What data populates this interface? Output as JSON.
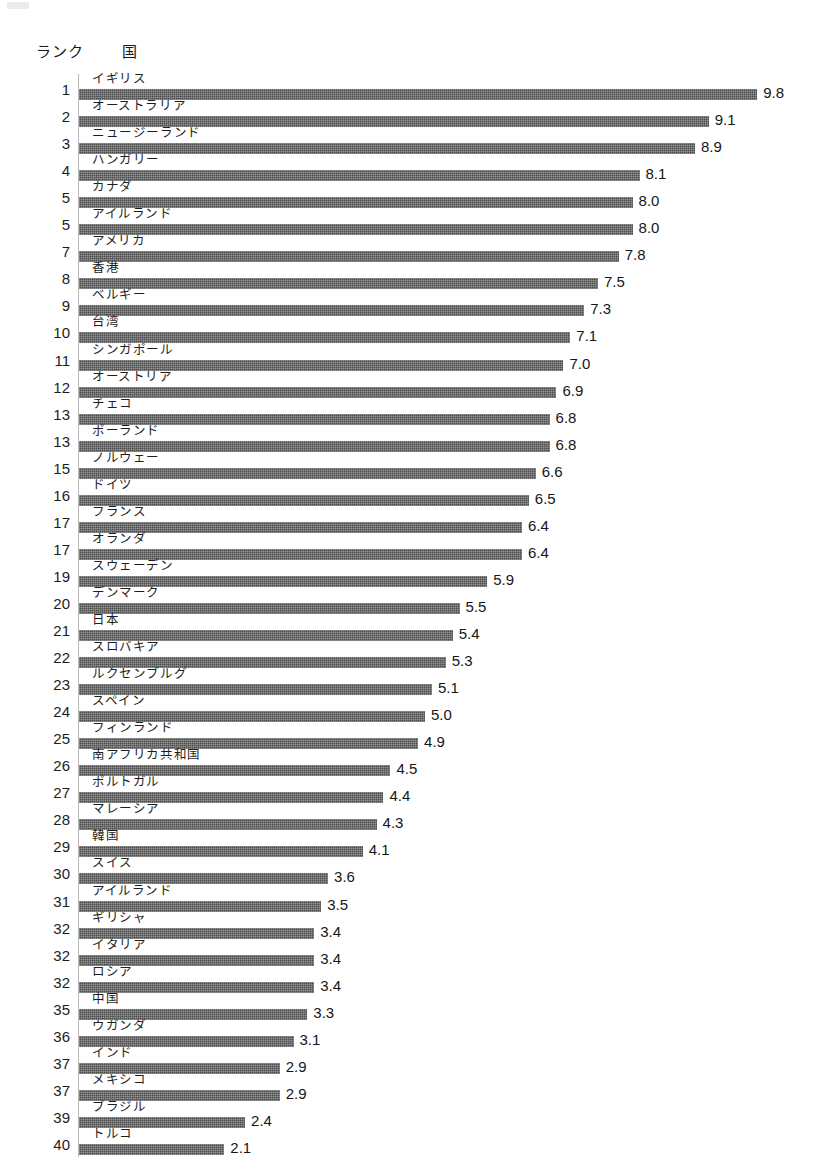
{
  "header": {
    "rank_label": "ランク",
    "country_label": "国"
  },
  "chart_data": {
    "type": "bar",
    "orientation": "horizontal",
    "title": "",
    "subtitle": "",
    "xlabel": "",
    "ylabel": "",
    "xlim": [
      0,
      10
    ],
    "grid": false,
    "legend": null,
    "bar_color": "#4d4d4d",
    "background_color": "#ffffff",
    "value_format": "one-decimal",
    "categories": [
      "イギリス",
      "オーストラリア",
      "ニュージーランド",
      "ハンガリー",
      "カナダ",
      "アイルランド",
      "アメリカ",
      "香港",
      "ベルギー",
      "台湾",
      "シンガポール",
      "オーストリア",
      "チェコ",
      "ポーランド",
      "ノルウェー",
      "ドイツ",
      "フランス",
      "オランダ",
      "スウェーデン",
      "デンマーク",
      "日本",
      "スロバキア",
      "ルクセンブルグ",
      "スペイン",
      "フィンランド",
      "南アフリカ共和国",
      "ポルトガル",
      "マレーシア",
      "韓国",
      "スイス",
      "アイルランド",
      "ギリシャ",
      "イタリア",
      "ロシア",
      "中国",
      "ウガンダ",
      "インド",
      "メキシコ",
      "ブラジル",
      "トルコ"
    ],
    "values": [
      9.8,
      9.1,
      8.9,
      8.1,
      8.0,
      8.0,
      7.8,
      7.5,
      7.3,
      7.1,
      7.0,
      6.9,
      6.8,
      6.8,
      6.6,
      6.5,
      6.4,
      6.4,
      5.9,
      5.5,
      5.4,
      5.3,
      5.1,
      5.0,
      4.9,
      4.5,
      4.4,
      4.3,
      4.1,
      3.6,
      3.5,
      3.4,
      3.4,
      3.4,
      3.3,
      3.1,
      2.9,
      2.9,
      2.4,
      2.1
    ],
    "ranks": [
      "1",
      "2",
      "3",
      "4",
      "5",
      "5",
      "7",
      "8",
      "9",
      "10",
      "11",
      "12",
      "13",
      "13",
      "15",
      "16",
      "17",
      "17",
      "19",
      "20",
      "21",
      "22",
      "23",
      "24",
      "25",
      "26",
      "27",
      "28",
      "29",
      "30",
      "31",
      "32",
      "32",
      "32",
      "35",
      "36",
      "37",
      "37",
      "39",
      "40"
    ],
    "value_labels": [
      "9.8",
      "9.1",
      "8.9",
      "8.1",
      "8.0",
      "8.0",
      "7.8",
      "7.5",
      "7.3",
      "7.1",
      "7.0",
      "6.9",
      "6.8",
      "6.8",
      "6.6",
      "6.5",
      "6.4",
      "6.4",
      "5.9",
      "5.5",
      "5.4",
      "5.3",
      "5.1",
      "5.0",
      "4.9",
      "4.5",
      "4.4",
      "4.3",
      "4.1",
      "3.6",
      "3.5",
      "3.4",
      "3.4",
      "3.4",
      "3.3",
      "3.1",
      "2.9",
      "2.9",
      "2.4",
      "2.1"
    ]
  }
}
